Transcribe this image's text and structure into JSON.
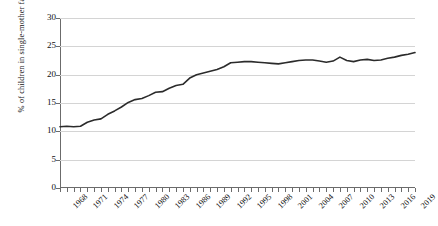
{
  "chart_data": {
    "type": "line",
    "title": "",
    "xlabel": "",
    "ylabel": "% of children in single-mother families",
    "ylim": [
      0,
      30
    ],
    "yticks": [
      0,
      5,
      10,
      15,
      20,
      25,
      30
    ],
    "xlim": [
      1968,
      2020
    ],
    "xticks": [
      1968,
      1971,
      1974,
      1977,
      1980,
      1983,
      1986,
      1989,
      1992,
      1995,
      1998,
      2001,
      2004,
      2007,
      2010,
      2013,
      2016,
      2019
    ],
    "grid": true,
    "legend": "none",
    "series": [
      {
        "name": "% of children in single-mother families",
        "color": "#2b2b2b",
        "x": [
          1968,
          1969,
          1970,
          1971,
          1972,
          1973,
          1974,
          1975,
          1976,
          1977,
          1978,
          1979,
          1980,
          1981,
          1982,
          1983,
          1984,
          1985,
          1986,
          1987,
          1988,
          1989,
          1990,
          1991,
          1992,
          1993,
          1994,
          1995,
          1996,
          1997,
          1998,
          1999,
          2000,
          2001,
          2002,
          2003,
          2004,
          2005,
          2006,
          2007,
          2008,
          2009,
          2010,
          2011,
          2012,
          2013,
          2014,
          2015,
          2016,
          2017,
          2018,
          2019,
          2020
        ],
        "values": [
          10.8,
          10.9,
          10.8,
          10.9,
          11.6,
          12.0,
          12.2,
          13.0,
          13.6,
          14.3,
          15.1,
          15.6,
          15.8,
          16.3,
          16.9,
          17.0,
          17.6,
          18.1,
          18.3,
          19.4,
          20.0,
          20.3,
          20.6,
          20.9,
          21.4,
          22.1,
          22.2,
          22.3,
          22.3,
          22.2,
          22.1,
          22.0,
          21.9,
          22.1,
          22.3,
          22.5,
          22.6,
          22.6,
          22.4,
          22.2,
          22.4,
          23.1,
          22.5,
          22.3,
          22.6,
          22.7,
          22.5,
          22.6,
          22.9,
          23.1,
          23.4,
          23.6,
          23.9
        ]
      }
    ]
  }
}
